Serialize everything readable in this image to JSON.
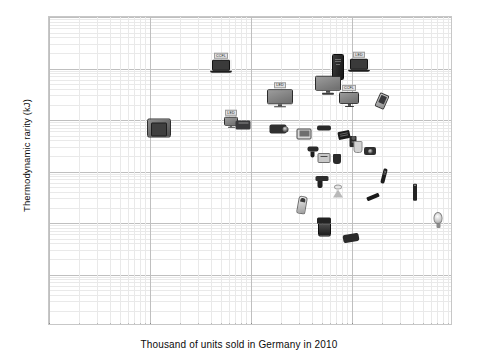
{
  "chart_data": {
    "type": "scatter",
    "title": "",
    "xlabel": "Thousand  of units sold in Germany  in 2010",
    "ylabel": "Thermodynamic rarity (kJ)",
    "xscale": "log",
    "yscale": "log",
    "xlim": [
      1,
      10000
    ],
    "ylim": [
      1,
      1000000
    ],
    "xticks": [
      "1",
      "10",
      "100",
      "1000",
      "10000"
    ],
    "yticks": [
      "1000000",
      "100000",
      "10000",
      "1000",
      "100",
      "10",
      "1"
    ],
    "grid": "both-minor-and-major",
    "legend": "none",
    "points": [
      {
        "label": "CCFL",
        "icon": "laptop-icon",
        "x": 110,
        "y": 120000,
        "px": 220,
        "py": 62
      },
      {
        "label": "LED",
        "icon": "laptop-icon",
        "x": 1900,
        "y": 130000,
        "px": 358,
        "py": 61
      },
      {
        "label": "",
        "icon": "desktop-tower-icon",
        "x": 830,
        "y": 100000,
        "px": 337,
        "py": 66
      },
      {
        "label": "",
        "icon": "crt-monitor-icon",
        "x": 18,
        "y": 6000,
        "px": 158,
        "py": 127
      },
      {
        "label": "LED",
        "icon": "tv-icon",
        "x": 430,
        "y": 22000,
        "px": 279,
        "py": 94
      },
      {
        "label": "",
        "icon": "tv-flat-icon",
        "x": 1250,
        "y": 35000,
        "px": 327,
        "py": 84
      },
      {
        "label": "CCFL",
        "icon": "monitor-icon",
        "x": 1700,
        "y": 22000,
        "px": 348,
        "py": 95
      },
      {
        "label": "LED",
        "icon": "monitor-small-icon",
        "x": 145,
        "y": 6500,
        "px": 230,
        "py": 118
      },
      {
        "label": "",
        "icon": "printer-icon",
        "x": 210,
        "y": 5200,
        "px": 242,
        "py": 124
      },
      {
        "label": "",
        "icon": "camcorder-icon",
        "x": 420,
        "y": 4200,
        "px": 277,
        "py": 128
      },
      {
        "label": "",
        "icon": "tablet-icon",
        "x": 780,
        "y": 3400,
        "px": 303,
        "py": 133
      },
      {
        "label": "",
        "icon": "mobile-phone-icon",
        "x": 3100,
        "y": 18000,
        "px": 381,
        "py": 100
      },
      {
        "label": "",
        "icon": "dvd-player-icon",
        "x": 1150,
        "y": 4300,
        "px": 323,
        "py": 127
      },
      {
        "label": "",
        "icon": "game-console-icon",
        "x": 1600,
        "y": 3200,
        "px": 343,
        "py": 134
      },
      {
        "label": "",
        "icon": "speaker-icon",
        "x": 1950,
        "y": 2600,
        "px": 352,
        "py": 140
      },
      {
        "label": "",
        "icon": "camera-icon",
        "x": 2600,
        "y": 1800,
        "px": 369,
        "py": 150
      },
      {
        "label": "",
        "icon": "kettle-icon",
        "x": 1850,
        "y": 2900,
        "px": 357,
        "py": 146
      },
      {
        "label": "",
        "icon": "hairdryer-icon",
        "x": 870,
        "y": 1600,
        "px": 312,
        "py": 151
      },
      {
        "label": "",
        "icon": "toaster-icon",
        "x": 1050,
        "y": 1400,
        "px": 323,
        "py": 157
      },
      {
        "label": "",
        "icon": "blender-icon",
        "x": 1300,
        "y": 1300,
        "px": 336,
        "py": 158
      },
      {
        "label": "",
        "icon": "remote-control-icon",
        "x": 3200,
        "y": 900,
        "px": 383,
        "py": 175
      },
      {
        "label": "",
        "icon": "usb-stick-icon",
        "x": 2500,
        "y": 420,
        "px": 372,
        "py": 196
      },
      {
        "label": "",
        "icon": "battery-icon",
        "x": 4200,
        "y": 330,
        "px": 414,
        "py": 191
      },
      {
        "label": "",
        "icon": "drill-icon",
        "x": 1050,
        "y": 620,
        "px": 321,
        "py": 181
      },
      {
        "label": "",
        "icon": "spotlight-bulb-icon",
        "x": 1450,
        "y": 450,
        "px": 337,
        "py": 190
      },
      {
        "label": "",
        "icon": "shaver-icon",
        "x": 760,
        "y": 250,
        "px": 301,
        "py": 204
      },
      {
        "label": "",
        "icon": "coffee-maker-icon",
        "x": 1000,
        "y": 95,
        "px": 323,
        "py": 226
      },
      {
        "label": "",
        "icon": "car-vacuum-icon",
        "x": 1450,
        "y": 70,
        "px": 350,
        "py": 237
      },
      {
        "label": "",
        "icon": "led-bulb-icon",
        "x": 5200,
        "y": 140,
        "px": 437,
        "py": 219
      }
    ]
  }
}
